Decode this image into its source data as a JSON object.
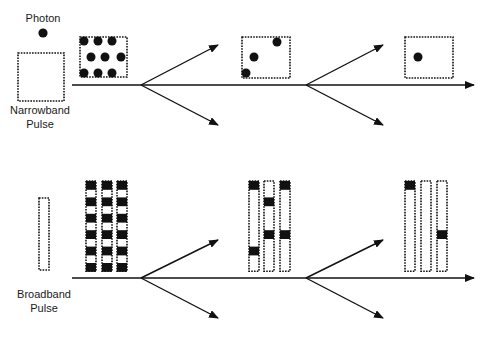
{
  "labels": {
    "photon": "Photon",
    "narrowband_line1": "Narrowband",
    "narrowband_line2": "Pulse",
    "broadband_line1": "Broadband",
    "broadband_line2": "Pulse"
  },
  "colors": {
    "ink": "#111111",
    "background": "#ffffff"
  },
  "diagram": {
    "top_row": {
      "description": "Narrowband pulse photons split at two beam splitters",
      "stage_photon_counts": [
        9,
        3,
        1
      ]
    },
    "bottom_row": {
      "description": "Broadband pulse (three time-bin columns) split at two beam splitters",
      "columns_per_stage": 3,
      "stage_filled_cells": [
        [
          [
            0,
            2,
            4,
            6,
            8,
            10
          ],
          [
            0,
            2,
            4,
            6,
            8,
            10
          ],
          [
            0,
            2,
            4,
            6,
            8,
            10
          ]
        ],
        [
          [
            0,
            8
          ],
          [
            2,
            6
          ],
          [
            0,
            6
          ]
        ],
        [
          [
            0
          ],
          [],
          [
            6
          ]
        ]
      ]
    }
  }
}
